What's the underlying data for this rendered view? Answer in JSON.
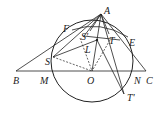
{
  "diagram": {
    "type": "geometry",
    "circle": {
      "center": "O",
      "through": [
        "M",
        "N",
        "S",
        "T'"
      ]
    },
    "points": {
      "A": {
        "label": "A",
        "x": 101,
        "y": 14
      },
      "B": {
        "label": "B",
        "x": 16,
        "y": 71
      },
      "C": {
        "label": "C",
        "x": 146,
        "y": 71
      },
      "M": {
        "label": "M",
        "x": 51,
        "y": 71
      },
      "O": {
        "label": "O",
        "x": 92,
        "y": 71
      },
      "N": {
        "label": "N",
        "x": 133,
        "y": 71
      },
      "F": {
        "label": "F",
        "x": 72,
        "y": 30
      },
      "E": {
        "label": "E",
        "x": 128,
        "y": 37
      },
      "S": {
        "label": "S",
        "x": 53,
        "y": 57
      },
      "Sp": {
        "label": "S'",
        "x": 90,
        "y": 31
      },
      "T": {
        "label": "T",
        "x": 109,
        "y": 34
      },
      "L": {
        "label": "L",
        "x": 97,
        "y": 40
      },
      "Tp": {
        "label": "T'",
        "x": 124,
        "y": 94
      }
    },
    "segments_solid": [
      "AB",
      "AC",
      "BC",
      "AS",
      "AS'",
      "AT",
      "AL",
      "AT'",
      "LO",
      "SL",
      "S'T",
      "FE",
      "LT'"
    ],
    "segments_dashed": [
      "SO",
      "S'O",
      "TO"
    ]
  }
}
